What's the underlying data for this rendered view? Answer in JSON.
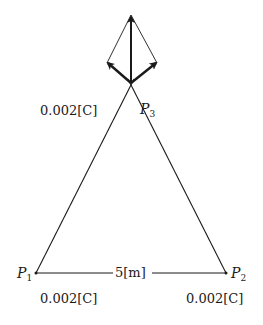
{
  "diagram": {
    "type": "electrostatics-force-diagram",
    "points": [
      {
        "id": "P1",
        "name": "P",
        "sub": "1",
        "charge": "0.002[C]",
        "x": 36,
        "y": 273
      },
      {
        "id": "P2",
        "name": "P",
        "sub": "2",
        "charge": "0.002[C]",
        "x": 226,
        "y": 273
      },
      {
        "id": "P3",
        "name": "P",
        "sub": "3",
        "charge": "0.002[C]",
        "x": 131,
        "y": 83
      }
    ],
    "side_length_label": "5[m]",
    "vectors": [
      {
        "name": "force-from-P2",
        "to": [
          107,
          63
        ],
        "bold": true
      },
      {
        "name": "force-from-P1",
        "to": [
          157,
          63
        ],
        "bold": true
      },
      {
        "name": "resultant-force",
        "to": [
          131,
          15
        ],
        "bold": true
      }
    ],
    "colors": {
      "line": "#1a1a1a",
      "background": "#ffffff"
    }
  }
}
